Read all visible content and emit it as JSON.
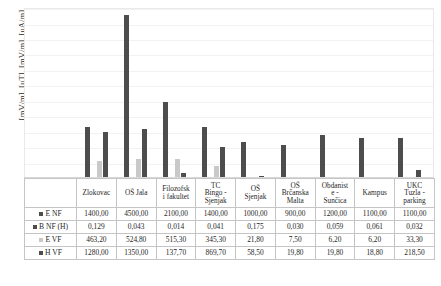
{
  "axis": {
    "ylabel": "[mV/m], [uT], [mV/m], [uA/m]"
  },
  "legend": [
    {
      "label": "E NF",
      "marker_color": "#4d4d4d",
      "marker_style": "dark"
    },
    {
      "label": "B NF (H)",
      "marker_color": "#4d4d4d",
      "marker_style": "dark"
    },
    {
      "label": "E VF",
      "marker_color": "#c9c9c9",
      "marker_style": "light"
    },
    {
      "label": "H VF",
      "marker_color": "#4d4d4d",
      "marker_style": "dark"
    }
  ],
  "chart_data": {
    "type": "bar",
    "title": "",
    "xlabel": "",
    "ylabel": "[mV/m], [uT], [mV/m], [uA/m]",
    "ylim": [
      0,
      4700
    ],
    "grid": true,
    "legend_position": "table-left",
    "categories": [
      "Zlokovac",
      "OŠ Jala",
      "Filozofski fakultet",
      "TC Bingo - Sjenjak",
      "OŠ Sjenjak",
      "OŠ Brčanska Malta",
      "Obdanište - Sunčica",
      "Kampus",
      "UKC Tuzla - parking"
    ],
    "category_lines": [
      [
        "Zlokovac"
      ],
      [
        "OŠ Jala"
      ],
      [
        "Filozofsk",
        "i fakultet"
      ],
      [
        "TC",
        "Bingo -",
        "Sjenjak"
      ],
      [
        "OŠ",
        "Sjenjak"
      ],
      [
        "OŠ",
        "Brčanska",
        "Malta"
      ],
      [
        "Obdanist",
        "e -",
        "Sunčica"
      ],
      [
        "Kampus"
      ],
      [
        "UKC",
        "Tuzla -",
        "parking"
      ]
    ],
    "series": [
      {
        "name": "E NF",
        "color": "#4d4d4d",
        "values": [
          1400.0,
          4500.0,
          2100.0,
          1400.0,
          1000.0,
          900.0,
          1200.0,
          1100.0,
          1100.0
        ],
        "display": [
          "1400,00",
          "4500,00",
          "2100,00",
          "1400,00",
          "1000,00",
          "900,00",
          "1200,00",
          "1100,00",
          "1100,00"
        ]
      },
      {
        "name": "B NF (H)",
        "color": "#4d4d4d",
        "values": [
          0.129,
          0.043,
          0.014,
          0.041,
          0.175,
          0.03,
          0.059,
          0.061,
          0.032
        ],
        "display": [
          "0,129",
          "0,043",
          "0,014",
          "0,041",
          "0,175",
          "0,030",
          "0,059",
          "0,061",
          "0,032"
        ]
      },
      {
        "name": "E VF",
        "color": "#c9c9c9",
        "values": [
          463.2,
          524.8,
          515.3,
          345.3,
          21.8,
          7.5,
          6.2,
          6.2,
          33.3
        ],
        "display": [
          "463,20",
          "524,80",
          "515,30",
          "345,30",
          "21,80",
          "7,50",
          "6,20",
          "6,20",
          "33,30"
        ]
      },
      {
        "name": "H VF",
        "color": "#4d4d4d",
        "values": [
          1280.0,
          1350.0,
          137.7,
          869.7,
          58.5,
          19.8,
          19.8,
          18.8,
          218.5
        ],
        "display": [
          "1280,00",
          "1350,00",
          "137,70",
          "869,70",
          "58,50",
          "19,80",
          "19,80",
          "18,80",
          "218,50"
        ]
      }
    ]
  }
}
